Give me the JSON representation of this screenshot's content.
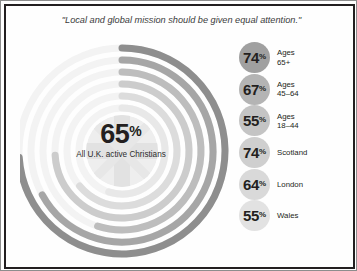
{
  "header": {
    "title": "Engaging in mission",
    "subtitle": "\"Local and global mission should be given equal attention.\""
  },
  "center": {
    "value": "65",
    "percent_symbol": "%",
    "caption": "All U.K. active\nChristians"
  },
  "stats": [
    {
      "value": "74",
      "percent_symbol": "%",
      "label": "Ages\n65+",
      "bubble_color": "#a0a0a0"
    },
    {
      "value": "67",
      "percent_symbol": "%",
      "label": "Ages\n45–64",
      "bubble_color": "#b4b4b4"
    },
    {
      "value": "55",
      "percent_symbol": "%",
      "label": "Ages\n18–44",
      "bubble_color": "#c4c4c4"
    },
    {
      "value": "74",
      "percent_symbol": "%",
      "label": "Scotland",
      "bubble_color": "#cfcfcf"
    },
    {
      "value": "64",
      "percent_symbol": "%",
      "label": "London",
      "bubble_color": "#d9d9d9"
    },
    {
      "value": "55",
      "percent_symbol": "%",
      "label": "Wales",
      "bubble_color": "#e2e2e2"
    }
  ],
  "chart_data": {
    "type": "pie",
    "title": "Engaging in mission",
    "subtitle": "\"Local and global mission should be given equal attention.\"",
    "center": {
      "label": "All U.K. active Christians",
      "value": 65,
      "unit": "%"
    },
    "categories": [
      "Ages 65+",
      "Ages 45–64",
      "Ages 18–44",
      "Scotland",
      "London",
      "Wales"
    ],
    "values": [
      74,
      67,
      55,
      74,
      64,
      55
    ],
    "ylabel": "Percent agreeing",
    "ylim": [
      0,
      100
    ],
    "legend": "none",
    "grid": false,
    "rings": [
      {
        "category": "Ages 65+",
        "value": 74,
        "radius": 103,
        "stroke": "#8e8e8e",
        "width": 7
      },
      {
        "category": "Ages 45–64",
        "value": 67,
        "radius": 91,
        "stroke": "#a6a6a6",
        "width": 7
      },
      {
        "category": "Ages 18–44",
        "value": 55,
        "radius": 79,
        "stroke": "#bdbdbd",
        "width": 7
      },
      {
        "category": "Scotland",
        "value": 74,
        "radius": 67,
        "stroke": "#cccccc",
        "width": 7
      },
      {
        "category": "London",
        "value": 64,
        "radius": 55,
        "stroke": "#dcdcdc",
        "width": 7
      },
      {
        "category": "Wales",
        "value": 55,
        "radius": 43,
        "stroke": "#e8e8e8",
        "width": 7
      }
    ]
  }
}
